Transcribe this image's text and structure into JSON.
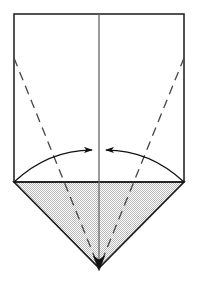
{
  "figure": {
    "background_color": "#ffffff",
    "stroke_color": "#1a1a1a",
    "shade_fill_color": "#c8c8c8",
    "shade_pattern": "fine-checkerboard",
    "center_line_color": "#555555",
    "dash_color": "#4a4a4a",
    "arrow_color": "#111111",
    "canvas": {
      "width": 199,
      "height": 285
    },
    "shapes": {
      "rectangle": {
        "name": "upper-square-panel",
        "x1": 14,
        "y1": 14,
        "x2": 184,
        "y2": 182,
        "filled": false
      },
      "triangle": {
        "name": "lower-shaded-triangle",
        "left_x": 14,
        "left_y": 182,
        "right_x": 184,
        "right_y": 182,
        "apex_x": 99,
        "apex_y": 268,
        "filled": true
      },
      "center_line": {
        "name": "vertical-center-crease",
        "x": 99,
        "y1": 14,
        "y2": 268
      },
      "dashed_creases": [
        {
          "name": "left-dashed-crease",
          "x1": 14,
          "y1": 58,
          "x2": 99,
          "y2": 268
        },
        {
          "name": "right-dashed-crease",
          "x1": 184,
          "y1": 58,
          "x2": 99,
          "y2": 268
        }
      ],
      "fold_arrows": [
        {
          "name": "left-fold-arrow",
          "start_x": 14,
          "start_y": 182,
          "end_x": 92,
          "end_y": 150,
          "control_x": 48,
          "control_y": 150,
          "direction": "inward-right"
        },
        {
          "name": "right-fold-arrow",
          "start_x": 184,
          "start_y": 182,
          "end_x": 106,
          "end_y": 150,
          "control_x": 150,
          "control_y": 150,
          "direction": "inward-left"
        }
      ],
      "apex_arrow": {
        "name": "apex-down-arrow",
        "x": 99,
        "y": 268,
        "direction": "down"
      }
    }
  }
}
